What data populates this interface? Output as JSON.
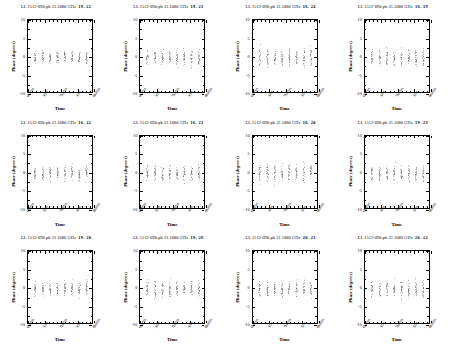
{
  "figure": {
    "kind": "phase-vs-time-panel-grid",
    "rows": 3,
    "columns": 4,
    "source": "1512-090.pb",
    "polarization": "LL",
    "frequency": "31.1080 GHz",
    "axis": {
      "ylabel": "Phase (degrees)",
      "xlabel": "Time",
      "ylim": [
        -10,
        10
      ],
      "yticks": [
        "10",
        "5",
        "0",
        "-5",
        "-10"
      ],
      "xticks": [
        "6h00m",
        "30m",
        "7h00m",
        "30m",
        "8h00m"
      ]
    }
  },
  "panels": [
    {
      "title": "LL  1512-090.pb 31.1080 GHz",
      "baseline": "19- 22"
    },
    {
      "title": "LL  1512-090.pb 31.1080 GHz",
      "baseline": "19- 23"
    },
    {
      "title": "LL  1512-090.pb 31.1080 GHz",
      "baseline": "16- 24"
    },
    {
      "title": "LL  1512-090.pb 31.1080 GHz",
      "baseline": "16- 19"
    },
    {
      "title": "LL  1512-090.pb 31.1080 GHz",
      "baseline": "16- 22"
    },
    {
      "title": "LL  1512-090.pb 31.1080 GHz",
      "baseline": "16- 23"
    },
    {
      "title": "LL  1512-090.pb 31.1080 GHz",
      "baseline": "16- 20"
    },
    {
      "title": "LL  1512-090.pb 31.1080 GHz",
      "baseline": "19- 23"
    },
    {
      "title": "LL  1512-090.pb 31.1080 GHz",
      "baseline": "19- 20"
    },
    {
      "title": "LL  1512-090.pb 31.1080 GHz",
      "baseline": "19- 26"
    },
    {
      "title": "LL  1512-090.pb 31.1080 GHz",
      "baseline": "20- 21"
    },
    {
      "title": "LL  1512-090.pb 31.1080 GHz",
      "baseline": "20- 22"
    }
  ],
  "chart_data": {
    "type": "scatter",
    "xlabel": "Time",
    "ylabel": "Phase (degrees)",
    "ylim": [
      -10,
      10
    ],
    "xlim": [
      0,
      1
    ],
    "grid": false,
    "legend": null,
    "x_tick_labels": [
      "6h00m",
      "30m",
      "7h00m",
      "30m",
      "8h00m"
    ],
    "y_tick_labels": [
      "10",
      "5",
      "0",
      "-5",
      "-10"
    ],
    "note": "Each panel shows one baseline; points form narrow vertical scan clusters centred near 0 degrees.",
    "scan_centers_x": [
      0.1,
      0.22,
      0.33,
      0.44,
      0.55,
      0.66,
      0.77,
      0.88
    ],
    "panel_series": [
      {
        "baseline": "19- 22",
        "mean": 0.0,
        "scatter": 1.6
      },
      {
        "baseline": "19- 23",
        "mean": 0.1,
        "scatter": 2.1
      },
      {
        "baseline": "16- 24",
        "mean": 0.0,
        "scatter": 2.4
      },
      {
        "baseline": "16- 19",
        "mean": -0.1,
        "scatter": 2.2
      },
      {
        "baseline": "16- 22",
        "mean": 0.0,
        "scatter": 1.9
      },
      {
        "baseline": "16- 23",
        "mean": 0.0,
        "scatter": 2.0
      },
      {
        "baseline": "16- 20",
        "mean": 0.1,
        "scatter": 2.3
      },
      {
        "baseline": "19- 23",
        "mean": 0.0,
        "scatter": 2.2
      },
      {
        "baseline": "19- 20",
        "mean": 0.0,
        "scatter": 1.8
      },
      {
        "baseline": "19- 26",
        "mean": 0.0,
        "scatter": 2.0
      },
      {
        "baseline": "20- 21",
        "mean": -0.1,
        "scatter": 2.1
      },
      {
        "baseline": "20- 22",
        "mean": 0.0,
        "scatter": 2.2
      }
    ]
  }
}
